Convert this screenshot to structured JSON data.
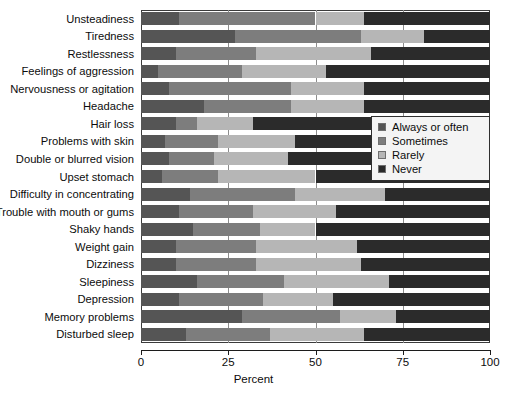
{
  "chart_data": {
    "type": "bar",
    "subtype": "horizontal-stacked-100",
    "title": "",
    "xlabel": "Percent",
    "ylabel": "",
    "xlim": [
      0,
      100
    ],
    "xticks": [
      0,
      25,
      50,
      75,
      100
    ],
    "xtick_labels": [
      "0",
      "25",
      "50",
      "75",
      "100"
    ],
    "grid": true,
    "grid_axis": "x",
    "legend_position": "middle-right",
    "categories": [
      "Unsteadiness",
      "Tiredness",
      "Restlessness",
      "Feelings of aggression",
      "Nervousness or agitation",
      "Headache",
      "Hair loss",
      "Problems with skin",
      "Double or blurred vision",
      "Upset stomach",
      "Difficulty in concentrating",
      "Trouble with mouth or gums",
      "Shaky hands",
      "Weight gain",
      "Dizziness",
      "Sleepiness",
      "Depression",
      "Memory problems",
      "Disturbed sleep"
    ],
    "series": [
      {
        "name": "Always or often",
        "color": "#555555",
        "values": [
          11,
          27,
          10,
          5,
          8,
          18,
          10,
          7,
          8,
          6,
          14,
          11,
          15,
          10,
          10,
          16,
          11,
          29,
          13
        ]
      },
      {
        "name": "Sometimes",
        "color": "#7d7d7d",
        "values": [
          39,
          36,
          23,
          24,
          35,
          25,
          6,
          15,
          13,
          16,
          30,
          21,
          19,
          23,
          23,
          25,
          24,
          28,
          24
        ]
      },
      {
        "name": "Rarely",
        "color": "#b6b6b6",
        "values": [
          14,
          18,
          33,
          24,
          21,
          21,
          16,
          22,
          21,
          28,
          26,
          24,
          16,
          29,
          30,
          30,
          20,
          16,
          27
        ]
      },
      {
        "name": "Never",
        "color": "#2b2b2b",
        "values": [
          36,
          19,
          34,
          47,
          36,
          36,
          68,
          56,
          58,
          50,
          30,
          44,
          50,
          38,
          37,
          29,
          45,
          27,
          36
        ]
      }
    ]
  },
  "legend": {
    "items": [
      {
        "label": "Always or often",
        "swatch": "s0"
      },
      {
        "label": "Sometimes",
        "swatch": "s1"
      },
      {
        "label": "Rarely",
        "swatch": "s2"
      },
      {
        "label": "Never",
        "swatch": "s3"
      }
    ]
  },
  "axis": {
    "title": "Percent"
  }
}
